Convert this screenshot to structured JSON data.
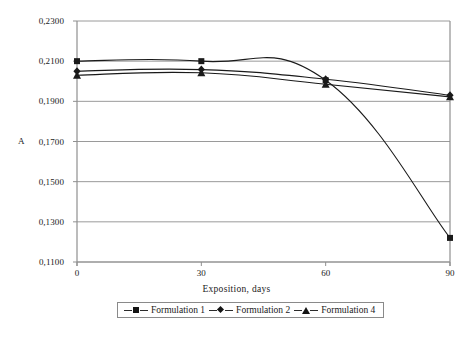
{
  "chart_data": {
    "type": "line",
    "title": "",
    "xlabel": "Exposition, days",
    "ylabel": "A",
    "x": [
      0,
      30,
      60,
      90
    ],
    "xlim": [
      0,
      90
    ],
    "ylim": [
      0.11,
      0.23
    ],
    "grid": true,
    "legend_position": "bottom",
    "xtick_labels": [
      "0",
      "30",
      "60",
      "90"
    ],
    "ytick_labels": [
      "0,2300",
      "0,2100",
      "0,1900",
      "0,1700",
      "0,1500",
      "0,1300",
      "0,1100"
    ],
    "ytick_values": [
      0.23,
      0.21,
      0.19,
      0.17,
      0.15,
      0.13,
      0.11
    ],
    "series": [
      {
        "name": "Formulation 1",
        "marker": "square",
        "color": "#1a1a1a",
        "values": [
          0.21,
          0.21,
          0.2005,
          0.122
        ]
      },
      {
        "name": "Formulation 2",
        "marker": "diamond",
        "color": "#1a1a1a",
        "values": [
          0.205,
          0.2058,
          0.201,
          0.193
        ]
      },
      {
        "name": "Formulation 4",
        "marker": "triangle",
        "color": "#1a1a1a",
        "values": [
          0.203,
          0.2042,
          0.1985,
          0.1922
        ]
      }
    ]
  },
  "legend": {
    "entries": [
      {
        "label": "Formulation 1"
      },
      {
        "label": "Formulation 2"
      },
      {
        "label": "Formulation 4"
      }
    ]
  },
  "axes": {
    "y_title": "A",
    "x_title": "Exposition, days"
  }
}
